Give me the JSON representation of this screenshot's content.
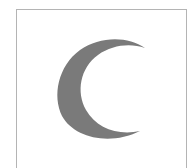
{
  "icon": {
    "name": "crescent-moon-icon",
    "fill_color": "#7a7a7a",
    "border_color": "#b4b4b4",
    "background": "#ffffff"
  }
}
